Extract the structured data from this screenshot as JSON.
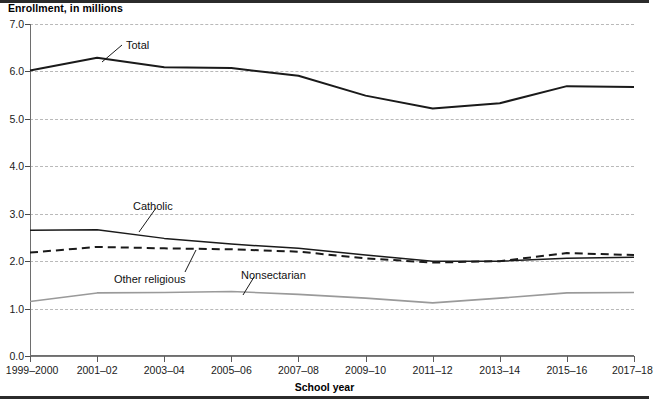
{
  "chart_data": {
    "type": "line",
    "title": "Enrollment, in millions",
    "xlabel": "School year",
    "ylabel": "Enrollment, in millions",
    "categories": [
      "1999–2000",
      "2001–02",
      "2003–04",
      "2005–06",
      "2007–08",
      "2009–10",
      "2011–12",
      "2013–14",
      "2015–16",
      "2017–18"
    ],
    "yticks": [
      "0.0",
      "1.0",
      "2.0",
      "3.0",
      "4.0",
      "5.0",
      "6.0",
      "7.0"
    ],
    "ylim": [
      0.0,
      7.0
    ],
    "grid": "horizontal-dashed",
    "legend": "inline-callouts",
    "series": [
      {
        "name": "Total",
        "style": "solid-black-thick",
        "color": "#1a1a1a",
        "values": [
          6.02,
          6.29,
          6.09,
          6.07,
          5.91,
          5.49,
          5.22,
          5.33,
          5.69,
          5.67
        ]
      },
      {
        "name": "Catholic",
        "style": "solid-black-thin",
        "color": "#1a1a1a",
        "values": [
          2.65,
          2.66,
          2.48,
          2.36,
          2.27,
          2.13,
          2.0,
          2.0,
          2.06,
          2.08
        ]
      },
      {
        "name": "Other religious",
        "style": "dashed-black",
        "color": "#1a1a1a",
        "values": [
          2.18,
          2.3,
          2.27,
          2.25,
          2.2,
          2.06,
          1.97,
          2.0,
          2.17,
          2.13
        ]
      },
      {
        "name": "Nonsectarian",
        "style": "solid-gray",
        "color": "#9a9a9a",
        "values": [
          1.15,
          1.33,
          1.34,
          1.36,
          1.3,
          1.22,
          1.12,
          1.22,
          1.33,
          1.34
        ]
      }
    ],
    "annotations": [
      {
        "label": "Total",
        "label_x": 126,
        "label_y": 39,
        "line_from_x": 122,
        "line_from_y": 45,
        "line_to_x": 102,
        "line_to_y": 62
      },
      {
        "label": "Catholic",
        "label_x": 133,
        "label_y": 200,
        "line_from_x": 156,
        "line_from_y": 208,
        "line_to_x": 139,
        "line_to_y": 232
      },
      {
        "label": "Other religious",
        "label_x": 114,
        "label_y": 273,
        "line_from_x": 185,
        "line_from_y": 272,
        "line_to_x": 196,
        "line_to_y": 250
      },
      {
        "label": "Nonsectarian",
        "label_x": 241,
        "label_y": 269,
        "line_from_x": 254,
        "line_from_y": 277,
        "line_to_x": 243,
        "line_to_y": 295
      }
    ]
  }
}
